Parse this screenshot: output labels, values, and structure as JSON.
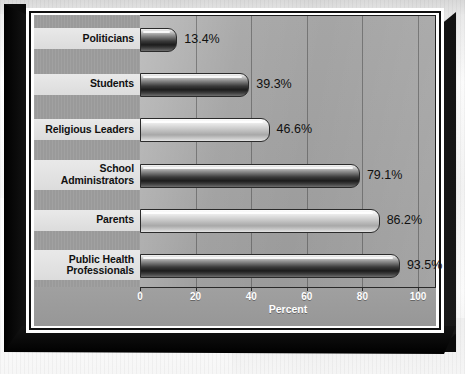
{
  "chart_data": {
    "type": "bar",
    "orientation": "horizontal",
    "title": "",
    "xlabel": "Percent",
    "ylabel": "",
    "xlim": [
      0,
      100
    ],
    "xticks": [
      0,
      20,
      40,
      60,
      80,
      100
    ],
    "xtick_labels": [
      "0",
      "20",
      "40",
      "60",
      "80",
      "100"
    ],
    "grid": true,
    "grid_axis": "x",
    "legend": false,
    "categories": [
      "Politicians",
      "Students",
      "Religious Leaders",
      "School\nAdministrators",
      "Parents",
      "Public Health\nProfessionals"
    ],
    "values": [
      13.4,
      39.3,
      46.6,
      79.1,
      86.2,
      93.5
    ],
    "value_labels": [
      "13.4%",
      "39.3%",
      "46.6%",
      "79.1%",
      "86.2%",
      "93.5%"
    ],
    "bar_shading": [
      "dark",
      "dark",
      "light",
      "dark",
      "light",
      "dark"
    ]
  },
  "axis": {
    "x_title": "Percent",
    "ticks": [
      "0",
      "20",
      "40",
      "60",
      "80",
      "100"
    ]
  },
  "colors": {
    "plate": "#9d9d9d",
    "label_row": "#e2e2e2",
    "plot_bg": "#a0a0a0",
    "frame": "#0b0b0b",
    "card_border": "#ffffff",
    "tick_text": "#ffffff",
    "value_text": "#101010",
    "label_text": "#111111",
    "gridline": "#3c3c3c"
  }
}
